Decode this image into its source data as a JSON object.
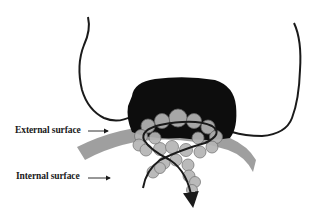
{
  "diagram": {
    "labels": {
      "external_surface": "External surface",
      "internal_surface": "Internal surface"
    },
    "colors": {
      "background": "#ffffff",
      "membrane": "#9a9a9a",
      "protein_cap": "#0d0d0d",
      "subunits": "#b5b5b5",
      "subunit_outline": "#6e6e6e",
      "chain_line": "#1a1a1a"
    },
    "elements": [
      "left-chain-loop",
      "right-chain-loop",
      "dark-protein-cap",
      "membrane-band",
      "bead-subunit-ring",
      "crossing-chain-with-arrow",
      "external-surface-pointer-arrow",
      "internal-surface-pointer-arrow"
    ]
  }
}
